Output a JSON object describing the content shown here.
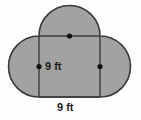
{
  "figure": {
    "name": "composite-geometric-figure",
    "fill_color": "#a2a2a2",
    "stroke_color": "#3a3a3a",
    "background_color": "#fdfdfd",
    "dot_color": "#111111",
    "labels": {
      "radius": "9 ft",
      "base": "9 ft"
    },
    "geometry": {
      "square": {
        "left_x": 39,
        "right_x": 100,
        "top_y": 36,
        "bottom_y": 97,
        "side_length": 61
      },
      "semicircle_left": {
        "center_x": 39,
        "center_y": 66.5,
        "radius": 30.5
      },
      "semicircle_right": {
        "center_x": 100,
        "center_y": 66.5,
        "radius": 30.5
      },
      "semicircle_top": {
        "center_x": 69.5,
        "center_y": 36,
        "radius": 30.5
      },
      "dots": [
        {
          "name": "left-center-dot",
          "x": 39,
          "y": 66.5
        },
        {
          "name": "right-center-dot",
          "x": 100,
          "y": 66.5
        },
        {
          "name": "top-center-dot",
          "x": 69.5,
          "y": 36
        }
      ]
    }
  }
}
